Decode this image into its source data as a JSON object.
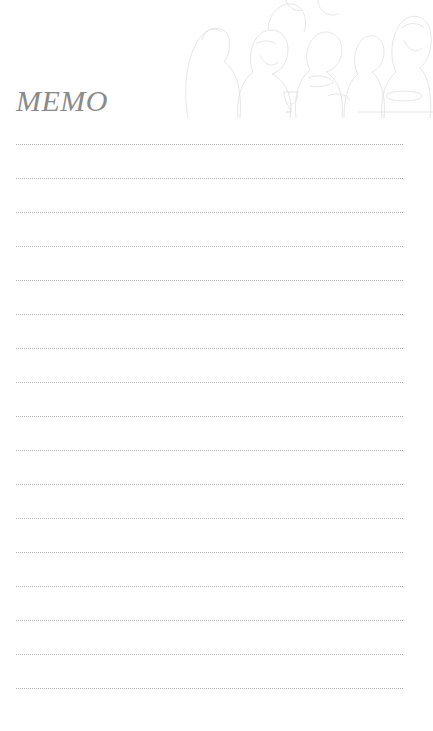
{
  "memo": {
    "title": "MEMO",
    "line_count": 17,
    "first_line_y": 144,
    "line_spacing": 34,
    "line_color": "#b5b5b5",
    "title_color": "#8a8a8a",
    "illustration": "last-supper-line-art"
  }
}
